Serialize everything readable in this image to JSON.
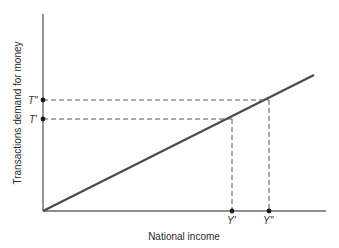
{
  "diagram": {
    "type": "economics-line-graph",
    "xlabel": "National income",
    "ylabel": "Transactions demand for money",
    "x_ticks": [
      {
        "label": "Y'",
        "x": 232
      },
      {
        "label": "Y\"",
        "x": 269
      }
    ],
    "y_ticks": [
      {
        "label": "T\"",
        "y": 100
      },
      {
        "label": "T'",
        "y": 119
      }
    ],
    "line": {
      "description": "Transactions demand rises linearly with national income",
      "start": [
        43,
        211
      ],
      "end": [
        314,
        75
      ]
    },
    "points": [
      {
        "name": "Y'-T' point",
        "x": 232,
        "y": 119
      },
      {
        "name": "Y\"-T\" point",
        "x": 269,
        "y": 100
      }
    ],
    "colors": {
      "line": "#4a4a4a",
      "axis": "#6a6a6a",
      "dots": "#1a1a1a",
      "background": "#ffffff"
    }
  }
}
